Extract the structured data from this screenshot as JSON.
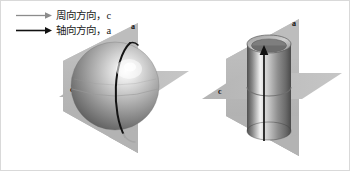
{
  "figure": {
    "background_color": "#ffffff",
    "border_color": "#d9d9d9",
    "width": 350,
    "height": 171
  },
  "legend": {
    "items": [
      {
        "arrow_icon": "arrow-right-gray-icon",
        "label": "周向方向，c",
        "color": "#8c8c8c",
        "direction_symbol": "c",
        "meaning": "circumferential direction"
      },
      {
        "arrow_icon": "arrow-right-black-icon",
        "label": "轴向方向，a",
        "color": "#111111",
        "direction_symbol": "a",
        "meaning": "axial direction"
      }
    ]
  },
  "diagrams": [
    {
      "name": "sphere-diagram",
      "shape": "sphere",
      "plane_color": "#b9b9b9",
      "plane_color_dark": "#a4a4a4",
      "axial_plane_label": "a",
      "circumferential_plane_label": "c",
      "meridian_color": "#141414",
      "body_light": "#f2f2f2",
      "body_mid": "#b0b0b0",
      "body_dark": "#6e6e6e"
    },
    {
      "name": "cylinder-diagram",
      "shape": "cylinder",
      "plane_color": "#b9b9b9",
      "plane_color_dark": "#a4a4a4",
      "axial_plane_label": "a",
      "circumferential_plane_label": "c",
      "axis_arrow_color": "#121212",
      "body_light": "#f0f0f0",
      "body_mid": "#a8a8a8",
      "body_dark": "#5e5e5e"
    }
  ]
}
